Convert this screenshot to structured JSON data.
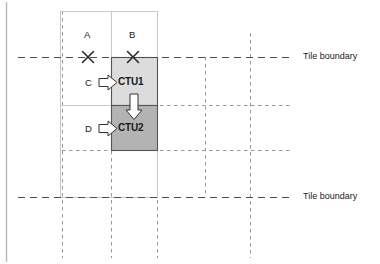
{
  "diagram": {
    "colors": {
      "ctu1_fill": "#dcdcdc",
      "ctu2_fill": "#b3b3b3",
      "block_stroke": "#555555",
      "grid_dashed": "#999999",
      "tile_dashed": "#4d4d4d",
      "frame_stroke": "#c8c8c8",
      "text": "#1a1a1a"
    },
    "neighbor_labels": [
      {
        "id": "A",
        "text": "A",
        "x": 84,
        "y": 31
      },
      {
        "id": "B",
        "text": "B",
        "x": 129,
        "y": 31
      }
    ],
    "side_labels": [
      {
        "id": "C",
        "text": "C",
        "x": 85,
        "y": 78
      },
      {
        "id": "D",
        "text": "D",
        "x": 85,
        "y": 124
      }
    ],
    "ctu_labels": [
      {
        "id": "CTU1",
        "text": "CTU1",
        "x": 120,
        "y": 77
      },
      {
        "id": "CTU2",
        "text": "CTU2",
        "x": 120,
        "y": 123
      }
    ],
    "tile_boundary_labels": [
      {
        "id": "top",
        "text": "Tile boundary",
        "x": 303,
        "y": 52
      },
      {
        "id": "bottom",
        "text": "Tile boundary",
        "x": 303,
        "y": 192
      }
    ],
    "cross_marks": [
      {
        "id": "cross-A",
        "cx": 88,
        "cy": 57,
        "r": 6
      },
      {
        "id": "cross-B",
        "cx": 133,
        "cy": 57,
        "r": 6
      }
    ],
    "blocks": [
      {
        "id": "ctu1",
        "x": 111,
        "y": 57,
        "w": 46,
        "h": 48,
        "fill": "#dcdcdc"
      },
      {
        "id": "ctu2",
        "x": 111,
        "y": 105,
        "w": 46,
        "h": 45,
        "fill": "#b3b3b3"
      }
    ],
    "frame": {
      "x": 60,
      "y": 11,
      "w": 97,
      "h": 186
    },
    "grid": {
      "dashed_vertical_x": [
        62,
        111,
        157,
        205,
        250
      ],
      "dashed_vertical_top": 11,
      "dashed_vertical_bottom": 258,
      "dashed_horizontal_y": [
        105,
        150
      ],
      "dashed_horizontal_left": 62,
      "dashed_horizontal_right": 290
    },
    "tile_lines": {
      "y_values": [
        57,
        197
      ],
      "x_start": 18,
      "x_end": 292
    }
  }
}
